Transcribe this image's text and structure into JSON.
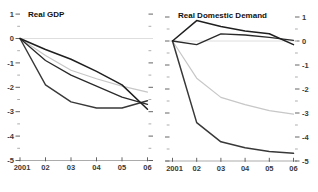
{
  "page": {
    "background": "#ffffff"
  },
  "chart_data": [
    {
      "type": "line",
      "title": "Real GDP",
      "x_tick_labels": [
        "2001",
        "02",
        "03",
        "04",
        "05",
        "06"
      ],
      "y_tick_labels": [
        "1",
        "0",
        "-1",
        "-2",
        "-3",
        "-4",
        "-5"
      ],
      "ylim": [
        -5,
        1
      ],
      "y_minor_tick_step": 0.5,
      "y_axis_side": "left",
      "grid": false,
      "legend_position": "none",
      "series": [
        {
          "name": "gdp-zero-reference-line",
          "color": "#dedede",
          "width": 1,
          "values": [
            0,
            0,
            0,
            0,
            0,
            0
          ]
        },
        {
          "name": "gdp-gray-line",
          "color": "#c7c7c7",
          "width": 1.2,
          "values": [
            0,
            -0.7,
            -1.3,
            -1.65,
            -1.95,
            -2.2
          ]
        },
        {
          "name": "gdp-dark-line-steep-early",
          "color": "#383838",
          "width": 1.4,
          "values": [
            0,
            -1.9,
            -2.6,
            -2.85,
            -2.85,
            -2.55
          ]
        },
        {
          "name": "gdp-dark-line-middle",
          "color": "#2a2a2a",
          "width": 1.3,
          "values": [
            0,
            -0.9,
            -1.5,
            -1.95,
            -2.4,
            -2.7
          ]
        },
        {
          "name": "gdp-dark-line-steep-late",
          "color": "#1f1f1f",
          "width": 1.5,
          "values": [
            0,
            -0.45,
            -0.85,
            -1.35,
            -1.9,
            -2.9
          ]
        }
      ]
    },
    {
      "type": "line",
      "title": "Real Domestic Demand",
      "x_tick_labels": [
        "2001",
        "02",
        "03",
        "04",
        "05",
        "06"
      ],
      "y_tick_labels": [
        "1",
        "0",
        "-1",
        "-2",
        "-3",
        "-4",
        "-5"
      ],
      "ylim": [
        -5,
        1
      ],
      "y_minor_tick_step": 0.5,
      "y_axis_side": "right",
      "grid": false,
      "legend_position": "none",
      "series": [
        {
          "name": "rdd-zero-reference-line",
          "color": "#dedede",
          "width": 1,
          "values": [
            0,
            0,
            0,
            0,
            0,
            0
          ]
        },
        {
          "name": "rdd-gray-line",
          "color": "#c7c7c7",
          "width": 1.2,
          "values": [
            0,
            -1.55,
            -2.35,
            -2.65,
            -2.9,
            -3.05
          ]
        },
        {
          "name": "rdd-dark-line-plunge",
          "color": "#383838",
          "width": 1.5,
          "values": [
            0,
            -3.4,
            -4.2,
            -4.45,
            -4.6,
            -4.68
          ]
        },
        {
          "name": "rdd-dark-line-dip-then-rise",
          "color": "#2a2a2a",
          "width": 1.3,
          "values": [
            0,
            -0.15,
            0.3,
            0.25,
            0.15,
            0.03
          ]
        },
        {
          "name": "rdd-dark-line-peak-early",
          "color": "#1f1f1f",
          "width": 1.5,
          "values": [
            0,
            0.85,
            0.6,
            0.42,
            0.3,
            -0.15
          ]
        }
      ]
    }
  ]
}
